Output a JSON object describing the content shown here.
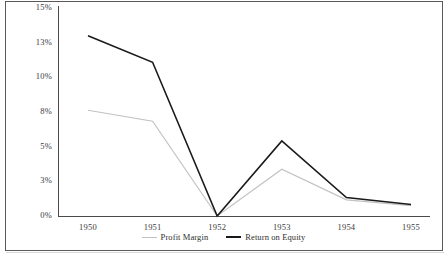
{
  "chart_data": {
    "type": "line",
    "title": "",
    "xlabel": "",
    "ylabel": "",
    "categories": [
      "1950",
      "1951",
      "1952",
      "1953",
      "1954",
      "1955"
    ],
    "ytick_labels": [
      "15%",
      "13%",
      "10%",
      "8%",
      "5%",
      "3%",
      "0%"
    ],
    "ytick_values": [
      15,
      13,
      10,
      8,
      5,
      3,
      0
    ],
    "ylim": [
      0,
      15
    ],
    "grid": false,
    "legend_position": "bottom-center",
    "series": [
      {
        "name": "Profit Margin",
        "color": "#c2c2c2",
        "values": [
          8.1,
          7.2,
          0.0,
          3.7,
          1.4,
          0.9
        ]
      },
      {
        "name": "Return on Equity",
        "color": "#1a1a1a",
        "values": [
          13.4,
          11.3,
          0.0,
          5.5,
          1.6,
          1.0
        ]
      }
    ]
  },
  "legend": {
    "items": [
      {
        "label": "Profit Margin"
      },
      {
        "label": "Return on Equity"
      }
    ]
  }
}
